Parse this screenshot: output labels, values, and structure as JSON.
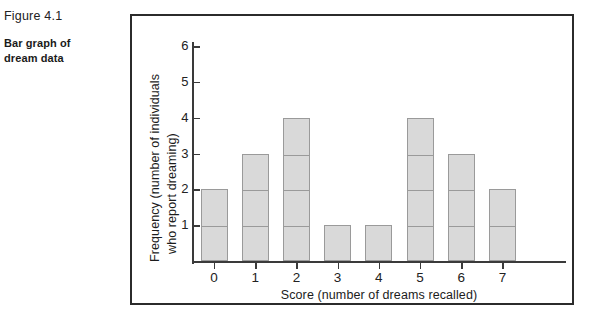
{
  "caption": {
    "figure_number": "Figure 4.1",
    "description": "Bar graph of\ndream data",
    "description_line1": "Bar graph of",
    "description_line2": "dream data"
  },
  "colors": {
    "bar_fill": "#d9d9d9",
    "bar_stroke": "#9a9a9a",
    "axis": "#3a3a3a",
    "frame": "#2b2b2b",
    "text": "#1a1a1a",
    "background": "#ffffff"
  },
  "chart_data": {
    "type": "bar",
    "title": "",
    "xlabel": "Score (number of dreams recalled)",
    "ylabel": "Frequency (number of individuals who report dreaming)",
    "ylabel_line1": "Frequency (number of individuals",
    "ylabel_line2": "who report dreaming)",
    "categories": [
      "0",
      "1",
      "2",
      "3",
      "4",
      "5",
      "6",
      "7"
    ],
    "values": [
      2,
      3,
      4,
      1,
      1,
      4,
      3,
      2
    ],
    "xtick_labels": [
      "0",
      "1",
      "2",
      "3",
      "4",
      "5",
      "6",
      "7"
    ],
    "ytick_labels": [
      "1",
      "2",
      "3",
      "4",
      "5",
      "6"
    ],
    "ytick_values": [
      1,
      2,
      3,
      4,
      5,
      6
    ],
    "ylim": [
      0,
      6.6
    ],
    "grid": false,
    "legend": false,
    "bars_segmented_by_unit": true
  }
}
